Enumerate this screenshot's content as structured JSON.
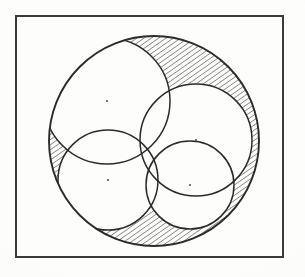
{
  "figure": {
    "caption": "",
    "background_color": "#fdfdfc",
    "ink_color": "#2b2b2b",
    "frame": {
      "label": "figure-border",
      "x": 16,
      "y": 16,
      "width": 267,
      "height": 241,
      "stroke_color": "#3a3a3a",
      "stroke_width": 2.2,
      "fill": "none"
    },
    "hatching": {
      "label": "diagonal-hatch",
      "angle_degrees": 55,
      "spacing": 4.2,
      "stroke_color": "#1f1f1f",
      "stroke_width": 0.9,
      "description": "Region inside the large circle but outside the union of the four inner circles"
    }
  },
  "chart_data": {
    "type": "diagram",
    "xlabel": "",
    "ylabel": "",
    "coordinate_space": {
      "width": 305,
      "height": 277,
      "origin": "top-left",
      "units": "pixels"
    },
    "common_point": {
      "name": "common-intersection-point",
      "x": 157,
      "y": 142
    },
    "circles": [
      {
        "name": "outer-circle",
        "role": "enclosing",
        "cx": 154,
        "cy": 141,
        "r": 105,
        "stroke_color": "#2b2b2b",
        "stroke_width": 1.9,
        "fill": "none",
        "center_dot": false
      },
      {
        "name": "circle-upper-left",
        "role": "inner",
        "cx": 107,
        "cy": 101,
        "r": 63,
        "stroke_color": "#2b2b2b",
        "stroke_width": 1.5,
        "fill": "none",
        "center_dot": true
      },
      {
        "name": "circle-lower-left",
        "role": "inner",
        "cx": 108,
        "cy": 180,
        "r": 50,
        "stroke_color": "#2b2b2b",
        "stroke_width": 1.5,
        "fill": "none",
        "center_dot": true
      },
      {
        "name": "circle-upper-right",
        "role": "inner",
        "cx": 196,
        "cy": 140,
        "r": 56,
        "stroke_color": "#2b2b2b",
        "stroke_width": 1.5,
        "fill": "none",
        "center_dot": true
      },
      {
        "name": "circle-lower-right",
        "role": "inner",
        "cx": 190,
        "cy": 185,
        "r": 44,
        "stroke_color": "#2b2b2b",
        "stroke_width": 1.5,
        "fill": "none",
        "center_dot": true
      }
    ],
    "center_dots": [
      {
        "name": "center-dot-upper-left",
        "x": 107,
        "y": 101,
        "r": 1.1
      },
      {
        "name": "center-dot-lower-left",
        "x": 108,
        "y": 180,
        "r": 1.1
      },
      {
        "name": "center-dot-upper-right",
        "x": 196,
        "y": 140,
        "r": 1.1
      },
      {
        "name": "center-dot-lower-right",
        "x": 190,
        "y": 185,
        "r": 1.1
      }
    ],
    "shaded_regions": [
      {
        "name": "hatched-lune-upper-left",
        "fill": "diagonal-hatch",
        "description": "Crescent between outer circle and upper-left inner circle"
      },
      {
        "name": "hatched-lune-lower-left",
        "fill": "diagonal-hatch",
        "description": "Crescent between outer circle and lower-left inner circle"
      },
      {
        "name": "hatched-lune-right",
        "fill": "diagonal-hatch",
        "description": "Thin crescent between outer circle and the right inner circles"
      }
    ],
    "legend": [],
    "annotations": []
  }
}
